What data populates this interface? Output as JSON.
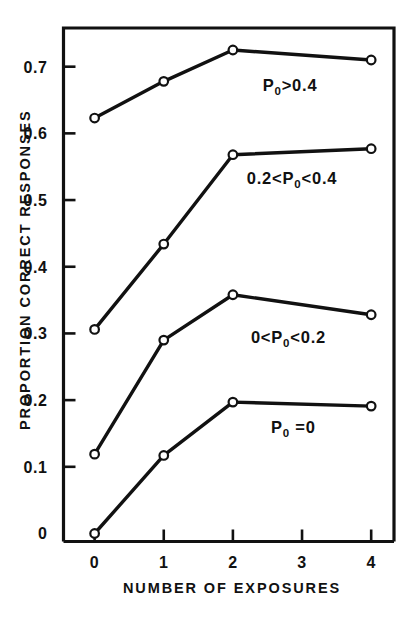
{
  "chart_data": {
    "type": "line",
    "title": "",
    "xlabel": "NUMBER OF EXPOSURES",
    "ylabel": "PROPORTION CORRECT RESPONSES",
    "x": [
      0,
      1,
      2,
      4
    ],
    "xlim": [
      -0.45,
      4.33
    ],
    "ylim": [
      -0.012,
      0.758
    ],
    "grid": false,
    "legend_position": "inline-annotations",
    "xticks": [
      {
        "value": 0,
        "label": "0"
      },
      {
        "value": 1,
        "label": "1"
      },
      {
        "value": 2,
        "label": "2"
      },
      {
        "value": 3,
        "label": "3"
      },
      {
        "value": 4,
        "label": "4"
      }
    ],
    "yticks": [
      {
        "value": 0,
        "label": "0"
      },
      {
        "value": 0.1,
        "label": "0.1"
      },
      {
        "value": 0.2,
        "label": "0.2"
      },
      {
        "value": 0.3,
        "label": "0.3"
      },
      {
        "value": 0.4,
        "label": "0.4"
      },
      {
        "value": 0.5,
        "label": "0.5"
      },
      {
        "value": 0.6,
        "label": "0.6"
      },
      {
        "value": 0.7,
        "label": "0.7"
      }
    ],
    "series": [
      {
        "name": "P0>0.4",
        "label_parts": {
          "pre": "P",
          "sub": "0",
          "post": ">0.4"
        },
        "label_x": 2.43,
        "label_y": 0.663,
        "x": [
          0,
          1,
          2,
          4
        ],
        "values": [
          0.623,
          0.678,
          0.725,
          0.71
        ]
      },
      {
        "name": "0.2<P0<0.4",
        "label_parts": {
          "pre": "0.2<P",
          "sub": "0",
          "post": "<0.4"
        },
        "label_x": 2.2,
        "label_y": 0.524,
        "x": [
          0,
          1,
          2,
          4
        ],
        "values": [
          0.306,
          0.434,
          0.568,
          0.577
        ]
      },
      {
        "name": "0<P0<0.2",
        "label_parts": {
          "pre": "0<P",
          "sub": "0",
          "post": "<0.2"
        },
        "label_x": 2.26,
        "label_y": 0.286,
        "x": [
          0,
          1,
          2,
          4
        ],
        "values": [
          0.119,
          0.29,
          0.358,
          0.328
        ]
      },
      {
        "name": "P0 =0",
        "label_parts": {
          "pre": "P",
          "sub": "0",
          "post": " =0"
        },
        "label_x": 2.55,
        "label_y": 0.15,
        "x": [
          0,
          1,
          2,
          4
        ],
        "values": [
          0.0,
          0.117,
          0.197,
          0.191
        ]
      }
    ],
    "colors": {
      "line": "#111111",
      "marker_fill": "#ffffff",
      "background": "#ffffff",
      "axis": "#111111"
    }
  }
}
